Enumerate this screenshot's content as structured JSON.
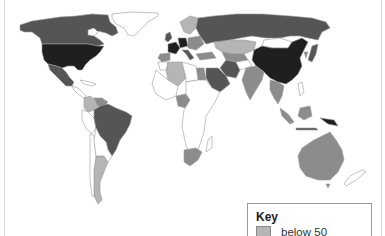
{
  "map": {
    "title": "",
    "colors": {
      "none": "#ffffff",
      "below_50": "#b5b5b5",
      "level_2": "#8c8c8c",
      "level_3": "#555555",
      "level_4": "#1f1f1f",
      "border": "#9a9a9a"
    }
  },
  "legend": {
    "title": "Key",
    "items": [
      {
        "label": "below 50",
        "color": "#b5b5b5"
      }
    ]
  }
}
